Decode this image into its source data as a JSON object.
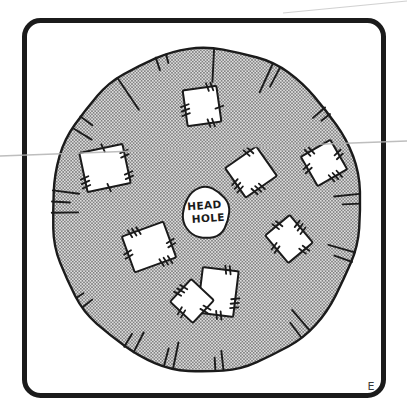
{
  "figure": {
    "head_hole_label_line1": "HEAD",
    "head_hole_label_line2": "HOLE",
    "panel_label": "E",
    "panel_letter_pos": {
      "x": 371,
      "y": 390,
      "size": 11
    }
  },
  "colors": {
    "ink": "#1b1b1b",
    "paper": "#ffffff",
    "halftone_base": "#dedede",
    "halftone_dot": "#565656",
    "scan_line": "#b3b3b3"
  },
  "frame": {
    "x": 24.5,
    "y": 20.5,
    "w": 359,
    "h": 375,
    "rx": 16,
    "stroke_w": 5
  },
  "poncho": {
    "cx": 206,
    "cy": 210,
    "rx": 155,
    "ry": 162,
    "stroke_w": 2.4,
    "jitter": [
      0.01,
      -0.006,
      0.014,
      0.002,
      -0.012,
      0.008,
      0.016,
      -0.004,
      0.006,
      -0.014,
      0.004,
      0.012,
      -0.008,
      0.01,
      -0.002,
      0.015,
      0.001,
      -0.01,
      0.012,
      -0.005,
      0.009,
      -0.013,
      0.003,
      0.013,
      -0.007,
      0.007,
      -0.011,
      0.005
    ]
  },
  "head_hole": {
    "cx": 206,
    "cy": 213,
    "rx": 24,
    "ry": 27,
    "stroke_w": 2,
    "jitter": [
      0.03,
      -0.04,
      0.05,
      -0.02,
      0.04,
      -0.05,
      0.02,
      0.05,
      -0.03,
      0.01
    ],
    "label1_x": 205,
    "label1_y": 209,
    "label2_x": 208,
    "label2_y": 222,
    "font_size": 10.5,
    "tilt": -4
  },
  "fringe_ticks": [
    {
      "a": -17,
      "n": 2,
      "len": 13,
      "gap": 4
    },
    {
      "a": 3,
      "n": 1,
      "len": 32,
      "gap": 3
    },
    {
      "a": 27,
      "n": 2,
      "len": 30,
      "gap": 3
    },
    {
      "a": 52,
      "n": 2,
      "len": 16,
      "gap": 3
    },
    {
      "a": 86,
      "n": 2,
      "len": 26,
      "gap": 3.5
    },
    {
      "a": 107,
      "n": 2,
      "len": 28,
      "gap": 3.5
    },
    {
      "a": 140,
      "n": 2,
      "len": 26,
      "gap": 4
    },
    {
      "a": 175,
      "n": 2,
      "len": 19,
      "gap": 3
    },
    {
      "a": -166,
      "n": 2,
      "len": 25,
      "gap": 3.5
    },
    {
      "a": -150,
      "n": 2,
      "len": 22,
      "gap": 4
    },
    {
      "a": -125,
      "n": 2,
      "len": 12,
      "gap": 4
    },
    {
      "a": -87,
      "n": 3,
      "len": 27,
      "gap": 4
    },
    {
      "a": -57,
      "n": 2,
      "len": 22,
      "gap": 5
    },
    {
      "a": -35,
      "n": 1,
      "len": 38,
      "gap": 3
    }
  ],
  "patches": [
    {
      "cx": 202,
      "cy": 106,
      "w": 34,
      "h": 36,
      "rot": -8,
      "stitches": [
        {
          "e": 3,
          "t": 0.45,
          "n": 3
        },
        {
          "e": 0,
          "t": 0.8,
          "n": 2
        },
        {
          "e": 2,
          "t": 0.3,
          "n": 2
        },
        {
          "e": 1,
          "t": 0.6,
          "n": 1
        }
      ]
    },
    {
      "cx": 105,
      "cy": 168,
      "w": 44,
      "h": 40,
      "rot": -12,
      "stitches": [
        {
          "e": 3,
          "t": 0.25,
          "n": 3
        },
        {
          "e": 0,
          "t": 0.55,
          "n": 1
        },
        {
          "e": 1,
          "t": 0.25,
          "n": 2
        },
        {
          "e": 1,
          "t": 0.8,
          "n": 2
        },
        {
          "e": 2,
          "t": 0.5,
          "n": 1
        }
      ]
    },
    {
      "cx": 251,
      "cy": 172,
      "w": 38,
      "h": 36,
      "rot": -35,
      "stitches": [
        {
          "e": 3,
          "t": 0.4,
          "n": 3
        },
        {
          "e": 0,
          "t": 0.75,
          "n": 2
        },
        {
          "e": 2,
          "t": 0.6,
          "n": 3
        }
      ]
    },
    {
      "cx": 324,
      "cy": 163,
      "w": 34,
      "h": 34,
      "rot": -30,
      "stitches": [
        {
          "e": 0,
          "t": 0.3,
          "n": 2
        },
        {
          "e": 3,
          "t": 0.6,
          "n": 2
        },
        {
          "e": 2,
          "t": 0.4,
          "n": 3
        },
        {
          "e": 1,
          "t": 0.5,
          "n": 2
        }
      ]
    },
    {
      "cx": 149,
      "cy": 247,
      "w": 44,
      "h": 38,
      "rot": -20,
      "stitches": [
        {
          "e": 0,
          "t": 0.3,
          "n": 3
        },
        {
          "e": 3,
          "t": 0.5,
          "n": 2
        },
        {
          "e": 2,
          "t": 0.25,
          "n": 3
        },
        {
          "e": 1,
          "t": 0.6,
          "n": 2
        }
      ]
    },
    {
      "cx": 289,
      "cy": 239,
      "w": 32,
      "h": 36,
      "rot": -40,
      "stitches": [
        {
          "e": 0,
          "t": 0.5,
          "n": 2
        },
        {
          "e": 1,
          "t": 0.45,
          "n": 3
        },
        {
          "e": 2,
          "t": 0.35,
          "n": 2
        },
        {
          "e": 3,
          "t": 0.55,
          "n": 2
        }
      ]
    },
    {
      "cx": 218,
      "cy": 292,
      "w": 36,
      "h": 46,
      "rot": 7,
      "stitches": [
        {
          "e": 3,
          "t": 0.25,
          "n": 2
        },
        {
          "e": 0,
          "t": 0.7,
          "n": 2
        },
        {
          "e": 1,
          "t": 0.7,
          "n": 3
        },
        {
          "e": 2,
          "t": 0.4,
          "n": 2
        }
      ]
    },
    {
      "cx": 192,
      "cy": 301,
      "w": 31,
      "h": 31,
      "rot": 43,
      "stitches": [
        {
          "e": 3,
          "t": 0.5,
          "n": 3
        },
        {
          "e": 2,
          "t": 0.5,
          "n": 2
        },
        {
          "e": 1,
          "t": 0.4,
          "n": 2
        }
      ]
    }
  ],
  "scan_lines": [
    {
      "x1": 0,
      "y1": 156,
      "x2": 407,
      "y2": 141,
      "w": 1.4,
      "opacity": 0.85
    },
    {
      "x1": 283,
      "y1": 13,
      "x2": 407,
      "y2": 1,
      "w": 1.2,
      "opacity": 0.6
    }
  ]
}
